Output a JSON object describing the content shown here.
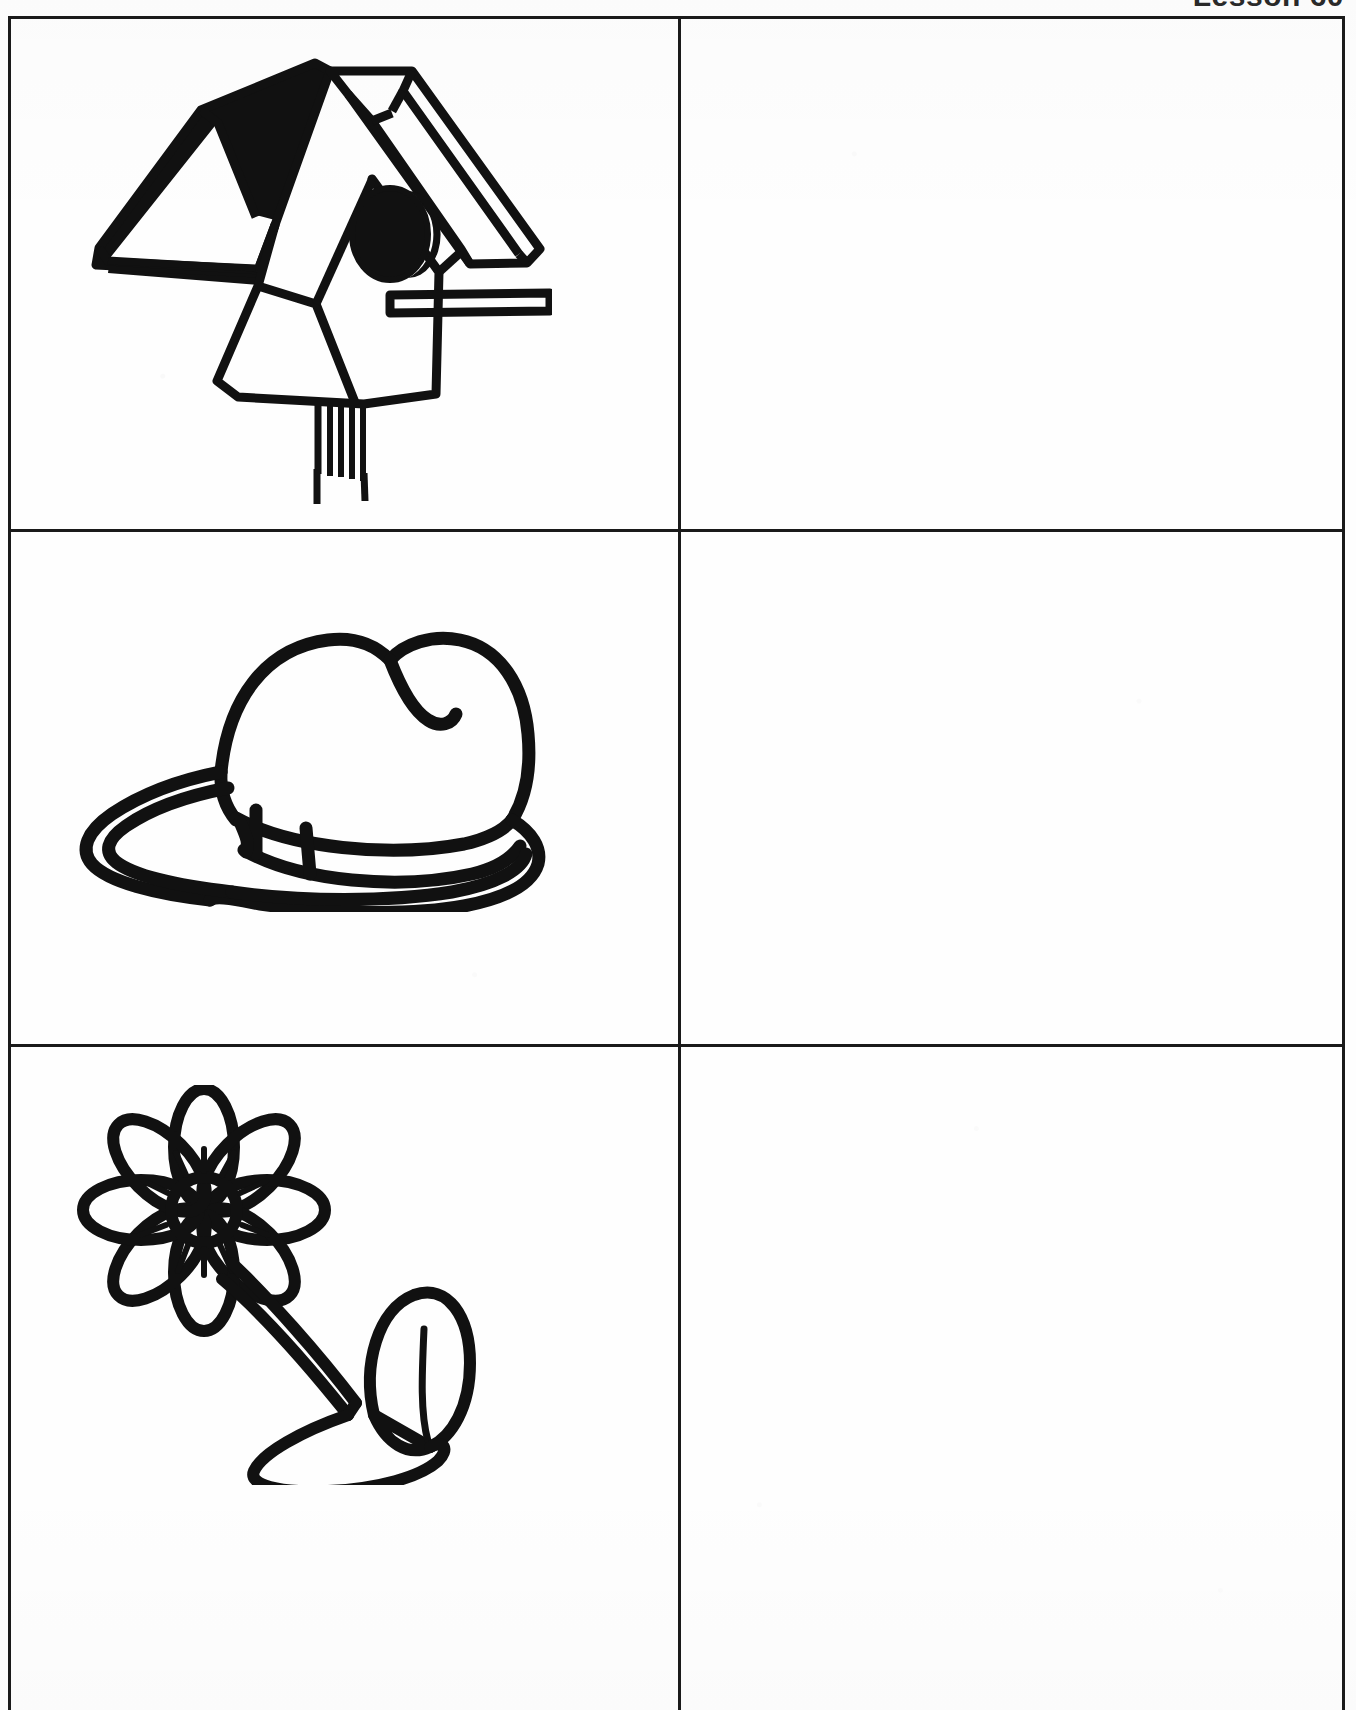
{
  "page": {
    "kind": "worksheet-page",
    "background_color": "#ffffff",
    "ink_color": "#111111",
    "grid_line_color": "#1a1a1a"
  },
  "header": {
    "left_text": "",
    "right_text": "Lesson 60",
    "note": "header text is clipped by the top edge of the scan"
  },
  "worksheet": {
    "columns": 2,
    "rows": 3,
    "column_headers": [
      "",
      ""
    ],
    "rows_data": [
      {
        "row_index": 1,
        "picture_cell": {
          "icon": "birdhouse-icon",
          "label": "birdhouse"
        },
        "answer_cell": {
          "value": "",
          "placeholder": ""
        }
      },
      {
        "row_index": 2,
        "picture_cell": {
          "icon": "cowboy-hat-icon",
          "label": "hat"
        },
        "answer_cell": {
          "value": "",
          "placeholder": ""
        }
      },
      {
        "row_index": 3,
        "picture_cell": {
          "icon": "flower-icon",
          "label": "flower"
        },
        "answer_cell": {
          "value": "",
          "placeholder": ""
        }
      }
    ]
  }
}
